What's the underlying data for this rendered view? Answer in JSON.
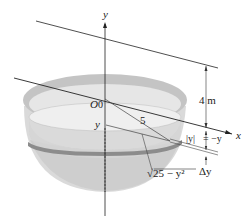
{
  "figure": {
    "colors": {
      "bowl_fill": "#d9d9d9",
      "bowl_shadow": "#bdbdbd",
      "rim_fill": "#c8c8c8",
      "slab_band": "#8c8c8c",
      "lines": "#222222",
      "background": "#ffffff"
    },
    "labels": {
      "y_axis": "y",
      "x_axis": "x",
      "origin": "O",
      "origin_value": "0",
      "depth_variable": "y",
      "radius": "5",
      "height": "4 m",
      "abs_y": "|y|",
      "equals_neg_y": "= −y",
      "slab_radius": "√25 − y²",
      "slab_thickness": "Δy"
    }
  }
}
